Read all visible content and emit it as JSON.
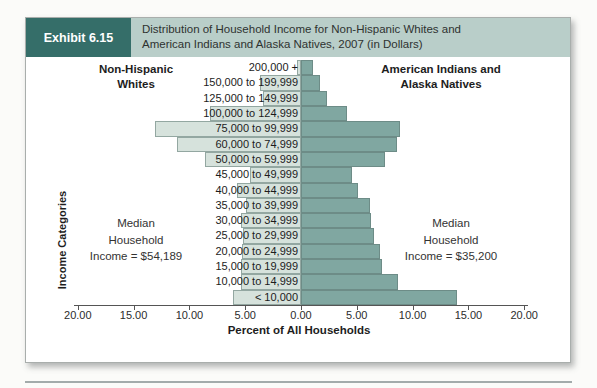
{
  "exhibit": {
    "label": "Exhibit 6.15",
    "title_lines": [
      "Distribution of Household Income for Non-Hispanic Whites and",
      "American Indians and Alaska Natives, 2007 (in Dollars)"
    ]
  },
  "group_headers": {
    "left_lines": [
      "Non-Hispanic",
      "Whites"
    ],
    "right_lines": [
      "American Indians and",
      "Alaska Natives"
    ]
  },
  "annotations": {
    "left_median_lines": [
      "Median",
      "Household",
      "Income = $54,189"
    ],
    "right_median_lines": [
      "Median",
      "Household",
      "Income = $35,200"
    ]
  },
  "chart_data": {
    "type": "bar",
    "variant": "diverging-horizontal-pyramid",
    "title": "Distribution of Household Income for Non-Hispanic Whites and American Indians and Alaska Natives, 2007 (in Dollars)",
    "xlabel": "Percent of All Households",
    "ylabel": "Income Categories",
    "grid": false,
    "x_max_each_side": 20,
    "x_tick_step": 5,
    "x_tick_labels": [
      "20.00",
      "15.00",
      "10.00",
      "5.00",
      "0.00",
      "5.00",
      "10.00",
      "15.00",
      "20.00"
    ],
    "categories": [
      "200,000 +",
      "150,000 to 199,999",
      "125,000 to 149,999",
      "100,000 to 124,999",
      "75,000 to 99,999",
      "60,000 to 74,999",
      "50,000 to 59,999",
      "45,000 to 49,999",
      "40,000 to 44,999",
      "35,000 to 39,999",
      "30,000 to 34,999",
      "25,000 to 29,999",
      "20,000 to 24,999",
      "15,000 to 19,999",
      "10,000 to 14,999",
      "< 10,000"
    ],
    "series": [
      {
        "name": "Non-Hispanic Whites",
        "side": "left",
        "color": "#d6e2dc",
        "median_household_income": "$54,189",
        "values": [
          0.4,
          3.7,
          3.4,
          8.2,
          13.1,
          11.1,
          8.6,
          4.6,
          5.7,
          4.9,
          5.4,
          5.2,
          5.3,
          5.4,
          5.4,
          6.1
        ]
      },
      {
        "name": "American Indians and Alaska Natives",
        "side": "right",
        "color": "#80a7a1",
        "median_household_income": "$35,200",
        "values": [
          1.1,
          1.7,
          2.3,
          4.1,
          8.9,
          8.6,
          7.5,
          4.6,
          5.1,
          6.2,
          6.3,
          6.5,
          7.1,
          7.3,
          8.7,
          14.0
        ]
      }
    ]
  },
  "colors": {
    "exhibit_box_bg": "#356e69",
    "title_strip_bg": "#b9cec9",
    "left_bar_fill": "#d6e2dc",
    "right_bar_fill": "#80a7a1",
    "axis": "#555555"
  }
}
